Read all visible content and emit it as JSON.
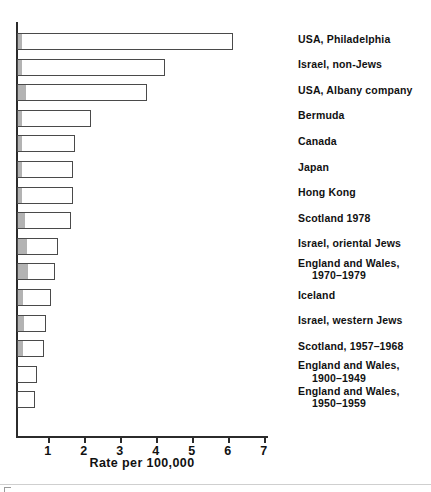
{
  "chart_data": {
    "type": "bar",
    "orientation": "horizontal",
    "title": "",
    "xlabel": "Rate per 100,000",
    "ylabel": "",
    "xlim": [
      0,
      7
    ],
    "xticks": [
      1,
      2,
      3,
      4,
      5,
      6,
      7
    ],
    "xtick_labels": [
      "1",
      "2",
      "3",
      "4",
      "5",
      "6",
      "7"
    ],
    "grid": false,
    "legend": false,
    "categories": [
      "USA, Philadelphia",
      "Israel, non-Jews",
      "USA, Albany company",
      "Bermuda",
      "Canada",
      "Japan",
      "Hong Kong",
      "Scotland 1978",
      "Israel, oriental Jews",
      "England and Wales,\n1970–1979",
      "Iceland",
      "Israel, western Jews",
      "Scotland, 1957–1968",
      "England and Wales,\n1900–1949",
      "England and Wales,\n1950–1959"
    ],
    "values": [
      6.0,
      4.1,
      3.6,
      2.05,
      1.6,
      1.55,
      1.55,
      1.5,
      1.15,
      1.05,
      0.95,
      0.8,
      0.75,
      0.55,
      0.5
    ],
    "segment_values": [
      0.12,
      0.1,
      0.22,
      0.12,
      0.12,
      0.12,
      0.12,
      0.2,
      0.25,
      0.28,
      0.15,
      0.18,
      0.15,
      0.0,
      0.0
    ],
    "bar_face_color": "#ffffff",
    "bar_edge_color": "#4a4a4a",
    "segment_color": "#b3b3b3",
    "axis_color": "#2b2b2b"
  },
  "labels": {
    "cat_0_line1": "USA, Philadelphia",
    "cat_1_line1": "Israel, non-Jews",
    "cat_2_line1": "USA, Albany company",
    "cat_3_line1": "Bermuda",
    "cat_4_line1": "Canada",
    "cat_5_line1": "Japan",
    "cat_6_line1": "Hong Kong",
    "cat_7_line1": "Scotland 1978",
    "cat_8_line1": "Israel, oriental Jews",
    "cat_9_line1": "England and Wales,",
    "cat_9_line2": "1970–1979",
    "cat_10_line1": "Iceland",
    "cat_11_line1": "Israel, western Jews",
    "cat_12_line1": "Scotland, 1957–1968",
    "cat_13_line1": "England and Wales,",
    "cat_13_line2": "1900–1949",
    "cat_14_line1": "England and Wales,",
    "cat_14_line2": "1950–1959"
  },
  "axis": {
    "title": "Rate per 100,000",
    "tick_1": "1",
    "tick_2": "2",
    "tick_3": "3",
    "tick_4": "4",
    "tick_5": "5",
    "tick_6": "6",
    "tick_7": "7"
  }
}
